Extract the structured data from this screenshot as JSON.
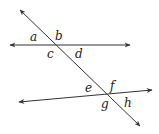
{
  "diagram": {
    "stroke_color": "#333333",
    "lines": [
      {
        "name": "top-line",
        "x1": 10,
        "y1": 45,
        "x2": 130,
        "y2": 45
      },
      {
        "name": "bottom-line",
        "x1": 19,
        "y1": 102,
        "x2": 152,
        "y2": 90
      },
      {
        "name": "transversal",
        "x1": 20,
        "y1": 10,
        "x2": 140,
        "y2": 126
      }
    ],
    "labels": {
      "a": "a",
      "b": "b",
      "c": "c",
      "d": "d",
      "e": "e",
      "f": "f",
      "g": "g",
      "h": "h"
    }
  }
}
